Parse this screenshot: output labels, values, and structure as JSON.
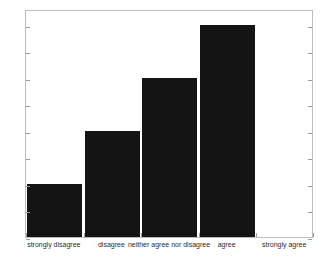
{
  "chart_data": {
    "type": "bar",
    "title": "",
    "subtitle": "",
    "xlabel": "",
    "ylabel": "",
    "categories": [
      "strongly disagree",
      "disagree",
      "neither agree nor disagree",
      "agree",
      "strongly agree"
    ],
    "values": [
      1,
      2,
      3,
      4,
      0
    ],
    "ylim": [
      0,
      4.3
    ],
    "yticks": [
      0,
      0.5,
      1,
      1.5,
      2,
      2.5,
      3,
      3.5,
      4
    ],
    "ytick_labels": [
      "0",
      "0.5",
      "1",
      "1.5",
      "2",
      "2.5",
      "3",
      "3.5",
      "4"
    ],
    "grid": false,
    "legend": null,
    "bar_color": "#141414",
    "axis_color": "#bdbdbd",
    "background_color": "#ffffff"
  }
}
